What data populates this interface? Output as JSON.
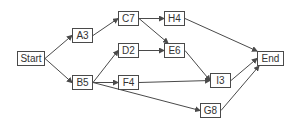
{
  "diagram": {
    "type": "network-graph",
    "nodes": [
      {
        "id": "start",
        "label": "Start",
        "x": 17,
        "y": 51,
        "w": 28,
        "h": 15
      },
      {
        "id": "a3",
        "label": "A3",
        "x": 72,
        "y": 28,
        "w": 21,
        "h": 15
      },
      {
        "id": "b5",
        "label": "B5",
        "x": 72,
        "y": 75,
        "w": 21,
        "h": 15
      },
      {
        "id": "c7",
        "label": "C7",
        "x": 118,
        "y": 11,
        "w": 21,
        "h": 15
      },
      {
        "id": "d2",
        "label": "D2",
        "x": 118,
        "y": 43,
        "w": 21,
        "h": 15
      },
      {
        "id": "f4",
        "label": "F4",
        "x": 118,
        "y": 75,
        "w": 21,
        "h": 15
      },
      {
        "id": "h4",
        "label": "H4",
        "x": 164,
        "y": 11,
        "w": 21,
        "h": 15
      },
      {
        "id": "e6",
        "label": "E6",
        "x": 164,
        "y": 43,
        "w": 21,
        "h": 15
      },
      {
        "id": "i3",
        "label": "I3",
        "x": 210,
        "y": 73,
        "w": 21,
        "h": 15
      },
      {
        "id": "g8",
        "label": "G8",
        "x": 200,
        "y": 103,
        "w": 21,
        "h": 15
      },
      {
        "id": "end",
        "label": "End",
        "x": 257,
        "y": 51,
        "w": 27,
        "h": 15
      }
    ],
    "edges": [
      {
        "from": "start",
        "to": "a3"
      },
      {
        "from": "start",
        "to": "b5"
      },
      {
        "from": "a3",
        "to": "c7"
      },
      {
        "from": "c7",
        "to": "h4"
      },
      {
        "from": "c7",
        "to": "e6"
      },
      {
        "from": "b5",
        "to": "d2"
      },
      {
        "from": "b5",
        "to": "f4"
      },
      {
        "from": "b5",
        "to": "g8"
      },
      {
        "from": "d2",
        "to": "e6"
      },
      {
        "from": "e6",
        "to": "i3"
      },
      {
        "from": "f4",
        "to": "i3"
      },
      {
        "from": "h4",
        "to": "end"
      },
      {
        "from": "i3",
        "to": "end"
      },
      {
        "from": "g8",
        "to": "end"
      }
    ],
    "colors": {
      "line": "#4a4a4a",
      "box_border": "#4a4a4a",
      "text": "#333333",
      "background": "#ffffff"
    }
  }
}
